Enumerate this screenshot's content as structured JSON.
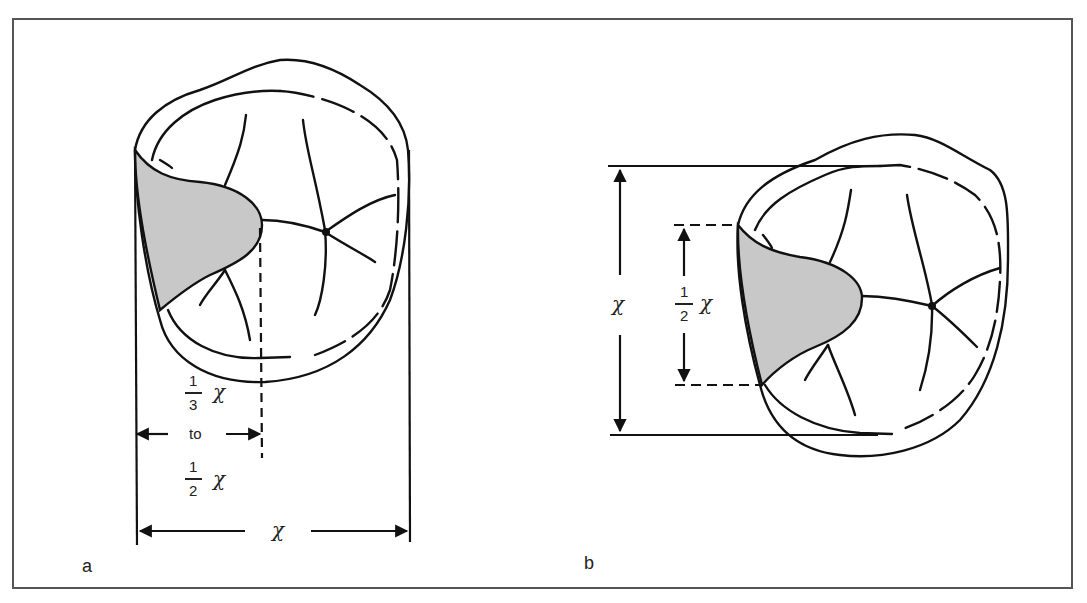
{
  "figure": {
    "panels": [
      {
        "id": "a",
        "label": "a",
        "dimension_labels": {
          "lower_fraction": {
            "numerator": "1",
            "denominator": "3",
            "variable": "χ"
          },
          "connector": "to",
          "upper_fraction": {
            "numerator": "1",
            "denominator": "2",
            "variable": "χ"
          },
          "full_width": "χ"
        }
      },
      {
        "id": "b",
        "label": "b",
        "dimension_labels": {
          "full_height": "χ",
          "half_fraction": {
            "numerator": "1",
            "denominator": "2",
            "variable": "χ"
          }
        }
      }
    ],
    "colors": {
      "stroke": "#111111",
      "shaded_region": "#c8c8c8",
      "frame": "#555555",
      "background": "#ffffff"
    }
  }
}
